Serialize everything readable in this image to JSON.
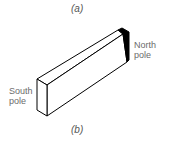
{
  "figure": {
    "caption_top": "(a)",
    "caption_bottom": "(b)"
  },
  "magnet": {
    "south_label_line1": "South",
    "south_label_line2": "pole",
    "north_label_line1": "North",
    "north_label_line2": "pole",
    "north_end_color": "#000000",
    "outline_color": "#000000",
    "face_color": "#ffffff"
  }
}
